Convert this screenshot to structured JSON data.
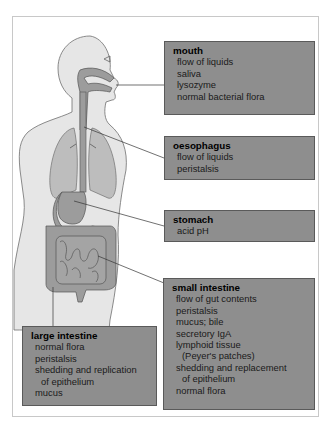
{
  "diagram": {
    "type": "anatomical-labelled-diagram",
    "colors": {
      "box_fill": "#8e8e8e",
      "box_border": "#5a5a5a",
      "body_fill": "#e6e6e6",
      "organ_fill": "#9c9c9c",
      "lung_fill": "#bdbdbd",
      "leader_line": "#333333"
    },
    "labels": [
      {
        "id": "mouth",
        "title": "mouth",
        "items": [
          "flow of liquids",
          "saliva",
          "lysozyme",
          "normal bacterial flora"
        ]
      },
      {
        "id": "oesophagus",
        "title": "oesophagus",
        "items": [
          "flow of liquids",
          "peristalsis"
        ]
      },
      {
        "id": "stomach",
        "title": "stomach",
        "items": [
          "acid pH"
        ]
      },
      {
        "id": "small-intestine",
        "title": "small intestine",
        "items": [
          "flow of gut contents",
          "peristalsis",
          "mucus; bile",
          "secretory IgA",
          "lymphoid tissue",
          "(Peyer's patches)",
          "shedding and replacement",
          "of epithelium",
          "normal flora"
        ]
      },
      {
        "id": "large-intestine",
        "title": "large intestine",
        "items": [
          "normal flora",
          "peristalsis",
          "shedding and replication",
          "of epithelium",
          "mucus"
        ]
      }
    ]
  }
}
